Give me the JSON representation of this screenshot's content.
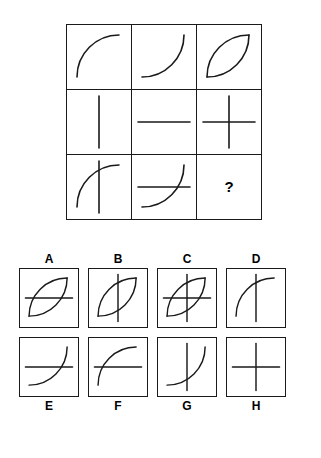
{
  "puzzle": {
    "type": "matrix-reasoning",
    "title": "",
    "rule": "third cell equals the overlay (union) of the first two cells in each row",
    "question_mark": "?",
    "stroke_color": "#1a1a1a",
    "border_color": "#1a1a1a",
    "background_color": "#ffffff"
  },
  "stroke_library": {
    "arc-upper-left": "M 10 52 A 42 42 0 0 1 52 10",
    "arc-lower-right": "M 52 10 A 42 42 0 0 1 10 52",
    "line-vertical": "M 32 6 L 32 58",
    "line-horizontal": "M 6 32 L 58 32"
  },
  "matrix": {
    "rows": [
      {
        "cells": [
          {
            "name": "cell-1-1",
            "strokes": [
              "arc-upper-left"
            ]
          },
          {
            "name": "cell-1-2",
            "strokes": [
              "arc-lower-right"
            ]
          },
          {
            "name": "cell-1-3",
            "strokes": [
              "arc-upper-left",
              "arc-lower-right"
            ]
          }
        ]
      },
      {
        "cells": [
          {
            "name": "cell-2-1",
            "strokes": [
              "line-vertical"
            ]
          },
          {
            "name": "cell-2-2",
            "strokes": [
              "line-horizontal"
            ]
          },
          {
            "name": "cell-2-3",
            "strokes": [
              "line-vertical",
              "line-horizontal"
            ]
          }
        ]
      },
      {
        "cells": [
          {
            "name": "cell-3-1",
            "strokes": [
              "arc-upper-left",
              "line-vertical"
            ]
          },
          {
            "name": "cell-3-2",
            "strokes": [
              "line-horizontal",
              "arc-lower-right"
            ]
          },
          {
            "name": "cell-3-3",
            "strokes": [],
            "is_question": true,
            "label": "?"
          }
        ]
      }
    ]
  },
  "options": {
    "top_row": [
      {
        "label": "A",
        "strokes": [
          "arc-upper-left",
          "line-horizontal",
          "arc-lower-right"
        ]
      },
      {
        "label": "B",
        "strokes": [
          "arc-upper-left",
          "line-vertical",
          "arc-lower-right"
        ]
      },
      {
        "label": "C",
        "strokes": [
          "arc-upper-left",
          "line-vertical",
          "line-horizontal",
          "arc-lower-right"
        ]
      },
      {
        "label": "D",
        "strokes": [
          "arc-upper-left",
          "line-vertical"
        ]
      }
    ],
    "bottom_row": [
      {
        "label": "E",
        "strokes": [
          "line-horizontal",
          "arc-lower-right"
        ]
      },
      {
        "label": "F",
        "strokes": [
          "arc-upper-left",
          "line-horizontal"
        ]
      },
      {
        "label": "G",
        "strokes": [
          "line-vertical",
          "arc-lower-right"
        ]
      },
      {
        "label": "H",
        "strokes": [
          "line-vertical",
          "line-horizontal"
        ]
      }
    ]
  }
}
